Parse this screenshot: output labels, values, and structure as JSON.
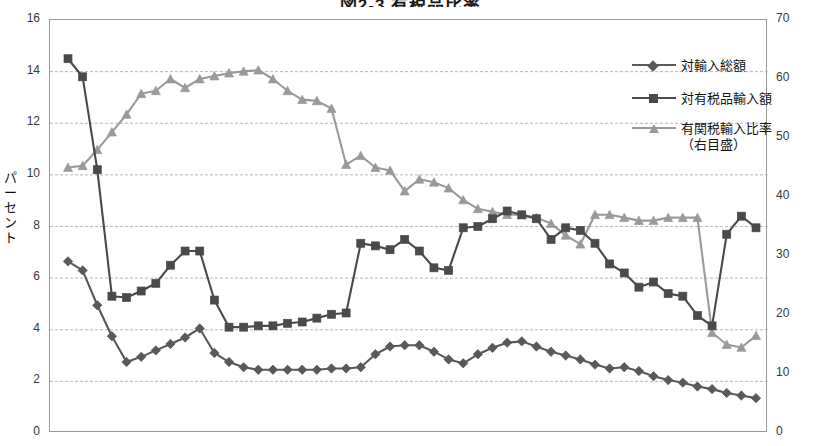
{
  "chart": {
    "title": "図2-3 有税品比率",
    "ylabel_left": "パーセント",
    "ylabel_left_chars": [
      "パ",
      "ー",
      "セ",
      "ン",
      "ト"
    ],
    "left_ticks": [
      "16",
      "14",
      "12",
      "10",
      "8",
      "6",
      "4",
      "2",
      "0"
    ],
    "right_ticks": [
      "70",
      "60",
      "50",
      "40",
      "30",
      "20",
      "10",
      "0"
    ],
    "legend": [
      {
        "label": "対輸入総額",
        "marker": "diamond",
        "color": "#595959"
      },
      {
        "label": "対有税品輸入額",
        "marker": "square",
        "color": "#4a4a4a"
      },
      {
        "label": "有関税輸入比率",
        "sublabel": "（右目盛）",
        "marker": "triangle",
        "color": "#9a9a9a"
      }
    ]
  },
  "chart_data": {
    "type": "line",
    "title": "図2-3 有税品比率",
    "xlabel": "",
    "ylabel": "パーセント",
    "ylabel_right": "",
    "ylim": [
      0,
      16
    ],
    "ylim_right": [
      0,
      70
    ],
    "grid": true,
    "legend_position": "top-right",
    "x": [
      1,
      2,
      3,
      4,
      5,
      6,
      7,
      8,
      9,
      10,
      11,
      12,
      13,
      14,
      15,
      16,
      17,
      18,
      19,
      20,
      21,
      22,
      23,
      24,
      25,
      26,
      27,
      28,
      29,
      30,
      31,
      32,
      33,
      34,
      35,
      36,
      37,
      38,
      39,
      40,
      41,
      42,
      43,
      44,
      45,
      46,
      47,
      48
    ],
    "series": [
      {
        "name": "対輸入総額",
        "marker": "diamond",
        "color": "#595959",
        "axis": "left",
        "values": [
          6.65,
          6.3,
          4.95,
          3.75,
          2.75,
          2.95,
          3.2,
          3.45,
          3.7,
          4.05,
          3.1,
          2.75,
          2.55,
          2.45,
          2.45,
          2.45,
          2.45,
          2.45,
          2.5,
          2.5,
          2.55,
          3.05,
          3.35,
          3.4,
          3.4,
          3.15,
          2.85,
          2.7,
          3.05,
          3.3,
          3.5,
          3.55,
          3.35,
          3.15,
          3.0,
          2.85,
          2.65,
          2.5,
          2.55,
          2.4,
          2.2,
          2.05,
          1.95,
          1.8,
          1.7,
          1.55,
          1.45,
          1.35
        ]
      },
      {
        "name": "対有税品輸入額",
        "marker": "square",
        "color": "#4a4a4a",
        "axis": "left",
        "values": [
          14.5,
          13.8,
          10.2,
          5.3,
          5.25,
          5.5,
          5.8,
          6.5,
          7.05,
          7.05,
          5.15,
          4.1,
          4.1,
          4.15,
          4.15,
          4.25,
          4.3,
          4.45,
          4.6,
          4.65,
          7.35,
          7.25,
          7.1,
          7.5,
          7.05,
          6.4,
          6.3,
          7.95,
          8.0,
          8.3,
          8.6,
          8.45,
          8.3,
          7.5,
          7.95,
          7.85,
          7.35,
          6.55,
          6.2,
          5.65,
          5.85,
          5.4,
          5.3,
          4.55,
          4.15,
          7.7,
          8.4,
          7.95
        ]
      },
      {
        "name": "有関税輸入比率",
        "marker": "triangle",
        "color": "#9a9a9a",
        "axis": "right",
        "values": [
          45.0,
          45.3,
          48.0,
          51.0,
          54.0,
          57.5,
          58.0,
          60.0,
          58.5,
          60.0,
          60.5,
          61.0,
          61.3,
          61.5,
          60.0,
          58.0,
          56.5,
          56.3,
          55.0,
          45.5,
          47.0,
          45.0,
          44.5,
          41.0,
          43.0,
          42.5,
          41.5,
          39.5,
          38.0,
          37.5,
          37.0,
          37.0,
          36.5,
          35.5,
          33.5,
          32.0,
          37.0,
          37.0,
          36.5,
          36.0,
          36.0,
          36.5,
          36.5,
          36.5,
          17.0,
          15.0,
          14.5,
          16.5
        ]
      }
    ]
  }
}
